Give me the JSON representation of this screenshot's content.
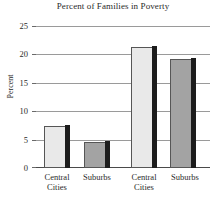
{
  "chart_data": {
    "type": "bar",
    "title": "Percent of Families in Poverty",
    "xlabel": "",
    "ylabel": "Percent",
    "categories": [
      "Central Cities",
      "Suburbs",
      "Central Cities",
      "Suburbs"
    ],
    "values": [
      7.5,
      4.6,
      21.5,
      19.3
    ],
    "ylim": [
      0,
      25
    ],
    "yticks": [
      0,
      5,
      10,
      15,
      20,
      25
    ],
    "ytick_labels": [
      "0",
      "5",
      "10",
      "15",
      "20",
      "25"
    ],
    "grid": true,
    "legend": false,
    "legend_position": "none",
    "bar_colors": [
      "#e9e9e9",
      "#a3a3a3",
      "#e9e9e9",
      "#a3a3a3"
    ],
    "groups": [
      {
        "label": "",
        "categories": [
          "Central Cities",
          "Suburbs"
        ],
        "values": [
          7.5,
          4.6
        ]
      },
      {
        "label": "",
        "categories": [
          "Central Cities",
          "Suburbs"
        ],
        "values": [
          21.5,
          19.3
        ]
      }
    ]
  },
  "axis": {
    "y_label": "Percent",
    "y_ticks": [
      "25",
      "20",
      "15",
      "10",
      "5",
      "0"
    ]
  },
  "xaxis": {
    "labels": [
      {
        "line1": "Central",
        "line2": "Cities"
      },
      {
        "line1": "Suburbs",
        "line2": ""
      },
      {
        "line1": "Central",
        "line2": "Cities"
      },
      {
        "line1": "Suburbs",
        "line2": ""
      }
    ]
  },
  "colors": {
    "bar_light": "#e9e9e9",
    "bar_dark": "#a3a3a3",
    "shadow": "#1c1c1c",
    "grid": "#9a9a9a",
    "axis": "#4a4a4a",
    "text": "#2a2a2a",
    "background": "#ffffff"
  }
}
